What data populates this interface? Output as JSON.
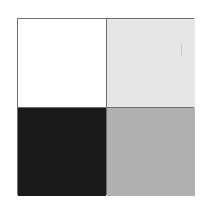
{
  "figure": {
    "rows": 2,
    "cols": 2,
    "border_color": "#6e6e6e",
    "cells": [
      {
        "position": "top-left",
        "color": "#ffffff",
        "label": "white"
      },
      {
        "position": "top-right",
        "color": "#e6e6e6",
        "label": "light-gray"
      },
      {
        "position": "bottom-left",
        "color": "#1a1a1a",
        "label": "black"
      },
      {
        "position": "bottom-right",
        "color": "#b0b0b0",
        "label": "medium-gray"
      }
    ]
  }
}
